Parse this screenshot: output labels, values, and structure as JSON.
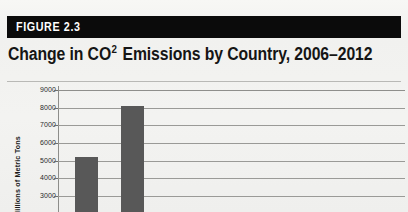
{
  "figure": {
    "banner_label": "FIGURE 2.3",
    "title_prefix": "Change in CO",
    "title_superscript": "2",
    "title_suffix": " Emissions by Country, 2006–2012",
    "title_full": "Change in CO2 Emissions by Country, 2006–2012"
  },
  "colors": {
    "banner_background": "#0b0b0b",
    "banner_text": "#ffffff",
    "page_background": "#f2f2f0",
    "title_text": "#151515",
    "bar_fill": "#585858",
    "gridline": "#9a9a97",
    "axis_line": "#8d8d8a"
  },
  "chart_data": {
    "type": "bar",
    "title": "Change in CO2 Emissions by Country, 2006–2012",
    "xlabel": "",
    "ylabel": "Millions of Metric Tons",
    "categories": [
      "Bar 1",
      "Bar 2"
    ],
    "values": [
      5200,
      8100
    ],
    "ylim": [
      3000,
      9000
    ],
    "yticks": [
      9000,
      8000,
      7000,
      6000,
      5000,
      4000,
      3000
    ],
    "ytick_labels": [
      "9000",
      "8000",
      "7000",
      "6000",
      "5000",
      "4000",
      "3000"
    ],
    "grid": true,
    "legend": "none",
    "note": "Chart is cropped at the bottom of the screenshot; axis continues below 3000 and category labels are not visible."
  }
}
